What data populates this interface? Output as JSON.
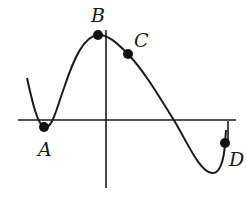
{
  "figure": {
    "colors": {
      "curve": "#1a1a1a",
      "axes": "#1a1a1a",
      "points": "#111111",
      "background": "#ffffff"
    },
    "points": [
      {
        "label": "A",
        "role": "local minimum near x-axis",
        "x": 44,
        "y": 127,
        "label_x": 38,
        "label_y": 156
      },
      {
        "label": "B",
        "role": "local maximum",
        "x": 98,
        "y": 35,
        "label_x": 91,
        "label_y": 22
      },
      {
        "label": "C",
        "role": "point on decreasing part, concave down",
        "x": 128,
        "y": 54,
        "label_x": 134,
        "label_y": 47
      },
      {
        "label": "D",
        "role": "point on increasing part, concave up, near right endpoint",
        "x": 225,
        "y": 143,
        "label_x": 229,
        "label_y": 166
      }
    ]
  },
  "labels": {
    "a": "A",
    "b": "B",
    "c": "C",
    "d": "D"
  }
}
